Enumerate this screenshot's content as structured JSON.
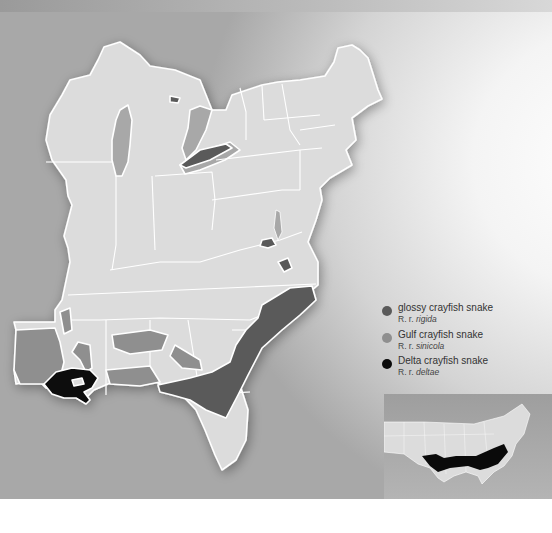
{
  "map": {
    "title": "Crayfish snake range map",
    "region": "Eastern United States"
  },
  "legend": {
    "items": [
      {
        "name": "glossy crayfish snake",
        "sci_prefix": "R. r.",
        "sci_sub": "rigida",
        "color": "#5a5a5a"
      },
      {
        "name": "Gulf crayfish snake",
        "sci_prefix": "R. r.",
        "sci_sub": "sinicola",
        "color": "#8f8f8f"
      },
      {
        "name": "Delta crayfish snake",
        "sci_prefix": "R. r.",
        "sci_sub": "deltae",
        "color": "#0a0a0a"
      }
    ]
  },
  "colors": {
    "land": "#dcdcdc",
    "border": "#ffffff",
    "rigida": "#5a5a5a",
    "sinicola": "#8f8f8f",
    "deltae": "#0a0a0a",
    "water_lake": "#a8a8a8"
  },
  "inset": {
    "label": "United States locator map"
  }
}
